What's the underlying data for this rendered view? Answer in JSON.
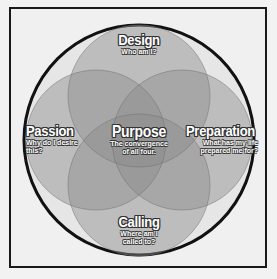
{
  "diagram": {
    "type": "venn-4-circle",
    "colors": {
      "page_background": "#f2f2f2",
      "frame_border": "#1a1a1a",
      "ring_fill": "#e6e6e6",
      "ring_border": "#111111",
      "petal_fill": "#8c8c8c",
      "petal_opacity": "0.45",
      "label_text": "#ffffff",
      "label_outline": "#333333"
    },
    "center": {
      "title": "Purpose",
      "subtitle_line1": "The convergence",
      "subtitle_line2": "of all four."
    },
    "circles": [
      {
        "id": "design",
        "title": "Design",
        "subtitle_line1": "Who am I?",
        "subtitle_line2": ""
      },
      {
        "id": "passion",
        "title": "Passion",
        "subtitle_line1": "Why do I desire",
        "subtitle_line2": "this?"
      },
      {
        "id": "preparation",
        "title": "Preparation",
        "subtitle_line1": "What has my life",
        "subtitle_line2": "prepared me for?"
      },
      {
        "id": "calling",
        "title": "Calling",
        "subtitle_line1": "Where am I",
        "subtitle_line2": "called to?"
      }
    ]
  }
}
